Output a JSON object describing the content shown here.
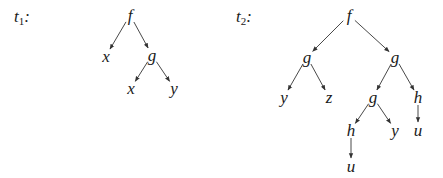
{
  "trees": [
    {
      "id": "t1",
      "label_main": "t",
      "label_sub": "1",
      "label_suffix": ":",
      "label_pos": [
        14,
        8
      ],
      "nodes": [
        {
          "id": "f",
          "text": "f",
          "x": 130,
          "y": 15
        },
        {
          "id": "x1",
          "text": "x",
          "x": 106,
          "y": 56
        },
        {
          "id": "g",
          "text": "g",
          "x": 152,
          "y": 55
        },
        {
          "id": "x2",
          "text": "x",
          "x": 131,
          "y": 88
        },
        {
          "id": "y",
          "text": "y",
          "x": 174,
          "y": 88
        }
      ],
      "edges": [
        [
          "f",
          "x1"
        ],
        [
          "f",
          "g"
        ],
        [
          "g",
          "x2"
        ],
        [
          "g",
          "y"
        ]
      ]
    },
    {
      "id": "t2",
      "label_main": "t",
      "label_sub": "2",
      "label_suffix": ":",
      "label_pos": [
        236,
        8
      ],
      "nodes": [
        {
          "id": "f",
          "text": "f",
          "x": 349,
          "y": 15
        },
        {
          "id": "gL",
          "text": "g",
          "x": 307,
          "y": 57
        },
        {
          "id": "gR",
          "text": "g",
          "x": 395,
          "y": 57
        },
        {
          "id": "y1",
          "text": "y",
          "x": 284,
          "y": 97
        },
        {
          "id": "z",
          "text": "z",
          "x": 329,
          "y": 97
        },
        {
          "id": "gM",
          "text": "g",
          "x": 373,
          "y": 97
        },
        {
          "id": "hR",
          "text": "h",
          "x": 418,
          "y": 97
        },
        {
          "id": "hL",
          "text": "h",
          "x": 351,
          "y": 130
        },
        {
          "id": "y2",
          "text": "y",
          "x": 395,
          "y": 130
        },
        {
          "id": "uR",
          "text": "u",
          "x": 418,
          "y": 130
        },
        {
          "id": "uL",
          "text": "u",
          "x": 351,
          "y": 166
        }
      ],
      "edges": [
        [
          "f",
          "gL"
        ],
        [
          "f",
          "gR"
        ],
        [
          "gL",
          "y1"
        ],
        [
          "gL",
          "z"
        ],
        [
          "gR",
          "gM"
        ],
        [
          "gR",
          "hR"
        ],
        [
          "gM",
          "hL"
        ],
        [
          "gM",
          "y2"
        ],
        [
          "hR",
          "uR"
        ],
        [
          "hL",
          "uL"
        ]
      ]
    }
  ],
  "colors": {
    "ink": "#1a1a1a",
    "edge": "#333333",
    "background": "#ffffff"
  }
}
